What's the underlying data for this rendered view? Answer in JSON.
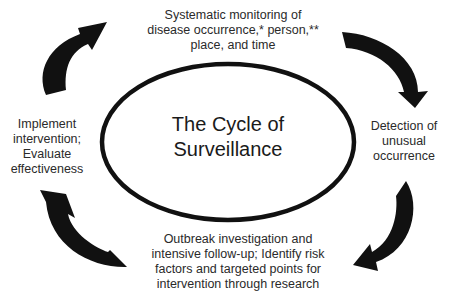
{
  "diagram": {
    "title": "The Cycle of\nSurveillance",
    "nodes": [
      {
        "id": "top",
        "text": "Systematic monitoring of\ndisease occurrence,* person,**\nplace, and time"
      },
      {
        "id": "right",
        "text": "Detection of\nunusual\noccurrence"
      },
      {
        "id": "bottom",
        "text": "Outbreak investigation and\nintensive follow-up; Identify risk\nfactors and targeted points for\nintervention through research"
      },
      {
        "id": "left",
        "text": "Implement\nintervention;\nEvaluate\neffectiveness"
      }
    ],
    "edges": [
      {
        "from": "top",
        "to": "right",
        "style": "curved-black-arrow"
      },
      {
        "from": "right",
        "to": "bottom",
        "style": "curved-black-arrow"
      },
      {
        "from": "bottom",
        "to": "left",
        "style": "curved-black-arrow"
      },
      {
        "from": "left",
        "to": "top",
        "style": "curved-black-arrow"
      }
    ],
    "colors": {
      "background": "#ffffff",
      "stroke": "#111111",
      "text": "#2a2a2a"
    }
  }
}
